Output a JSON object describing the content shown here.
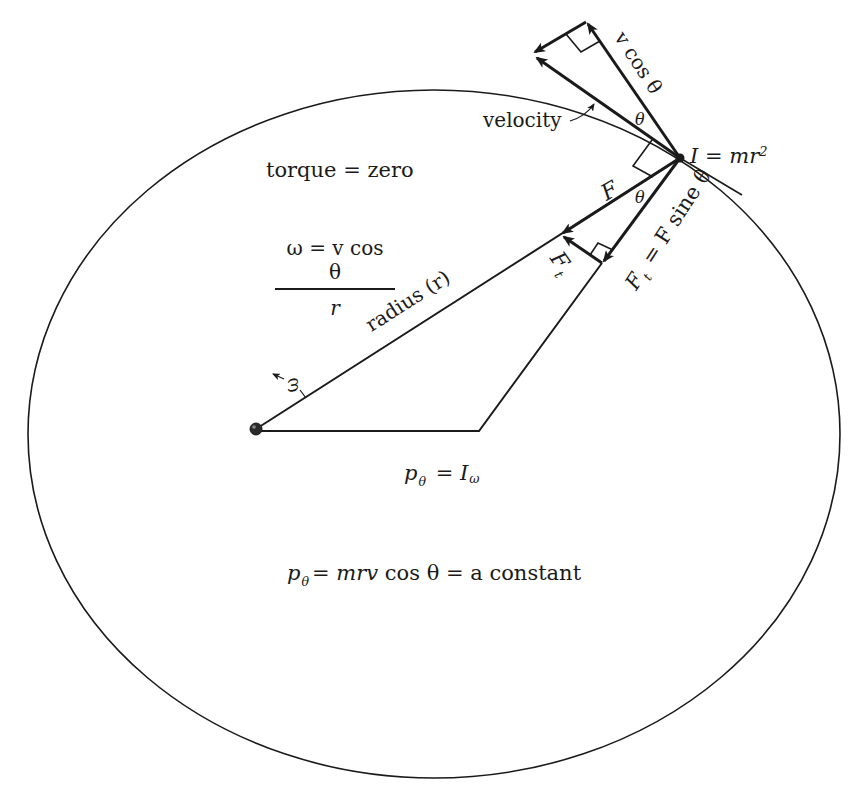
{
  "diagram": {
    "type": "physics-angular-momentum-orbit",
    "colors": {
      "ink": "#1a1a1a",
      "background": "#ffffff"
    },
    "orbit": {
      "shape": "ellipse",
      "cx": 434,
      "cy": 434,
      "rx": 406,
      "ry": 344
    },
    "pivot": {
      "x": 256,
      "y": 429
    },
    "mass": {
      "x": 680,
      "y": 158
    },
    "labels": {
      "torque": "torque = zero",
      "omega_numerator": "ω = v cos θ",
      "omega_denominator": "r",
      "radius": "radius (r)",
      "omega_symbol": "ω",
      "velocity": "velocity",
      "moment_of_inertia": {
        "lhs": "I",
        "eq": " = ",
        "rhs": "mr",
        "sup": "2"
      },
      "v_cos_theta": "v cos θ",
      "theta_top": "θ",
      "theta_mid": "θ",
      "force": "F",
      "tangential_force": {
        "main": "F",
        "sub": "t"
      },
      "ft_equation": {
        "main": "F",
        "sub": "t",
        "rest": " = F sine θ"
      },
      "p_theta_i_omega": {
        "main": "p",
        "sub": "θ",
        "rest": " = I",
        "sub2": "ω"
      },
      "p_theta_constant": {
        "main": "p",
        "sub": "θ",
        "rest_italic": "= mrv",
        "rest": " cos θ =  a constant"
      }
    }
  }
}
